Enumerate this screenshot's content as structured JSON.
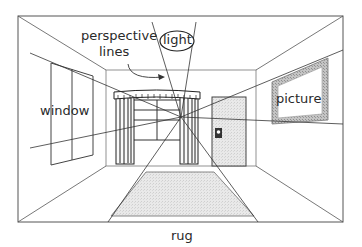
{
  "diagram": {
    "type": "perspective room illustration",
    "labels": {
      "perspective_lines": [
        "perspective",
        "lines"
      ],
      "light": "light",
      "window": "window",
      "picture": "picture",
      "rug": "rug"
    },
    "colors": {
      "line": "#3a3a3a",
      "rug_fill": "#e6e6e6",
      "door_fill": "#efefef",
      "frame_fill": "#bdbdbd",
      "background": "#ffffff"
    }
  }
}
